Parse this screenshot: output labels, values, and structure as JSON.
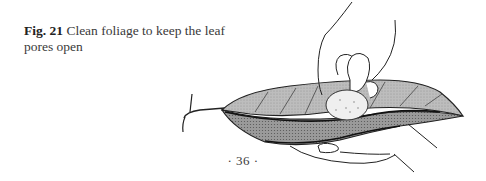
{
  "figure": {
    "label": "Fig. 21",
    "caption": " Clean foliage to keep the leaf pores open",
    "illustration": "hand-cleaning-leaf-illustration"
  },
  "footer": {
    "page_number": "· 36 ·"
  },
  "colors": {
    "paper": "#ffffff",
    "ink": "#2a2a2a",
    "leaf_shade": "#b8b8b8"
  }
}
